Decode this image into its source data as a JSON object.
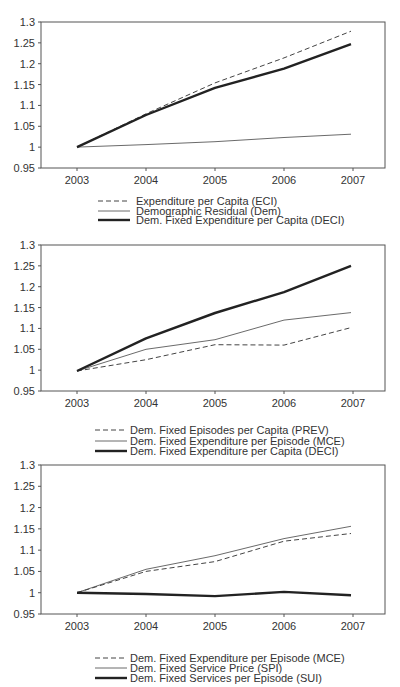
{
  "chart_data": [
    {
      "type": "line",
      "title": "",
      "xlabel": "",
      "ylabel": "",
      "categories": [
        "2003",
        "2004",
        "2005",
        "2006",
        "2007"
      ],
      "yticks": [
        "1.3",
        "1.25",
        "1.2",
        "1.15",
        "1.1",
        "1.05",
        "1",
        "0.95"
      ],
      "ylim": [
        0.95,
        1.3
      ],
      "grid": false,
      "legend_position": "bottom",
      "series": [
        {
          "name": "Expenditure per Capita (ECI)",
          "style": "dashed",
          "width": 1,
          "values": [
            1.0,
            1.08,
            1.154,
            1.214,
            1.278
          ]
        },
        {
          "name": "Demographic Residual (Dem)",
          "style": "solid",
          "width": 0.8,
          "values": [
            1.0,
            1.006,
            1.013,
            1.023,
            1.031
          ]
        },
        {
          "name": "Dem. Fixed Expenditure per Capita (DECI)",
          "style": "solid",
          "width": 2.4,
          "values": [
            1.0,
            1.077,
            1.142,
            1.188,
            1.247
          ]
        }
      ]
    },
    {
      "type": "line",
      "title": "",
      "xlabel": "",
      "ylabel": "",
      "categories": [
        "2003",
        "2004",
        "2005",
        "2006",
        "2007"
      ],
      "yticks": [
        "1.3",
        "1.25",
        "1.2",
        "1.15",
        "1.1",
        "1.05",
        "1",
        "0.95"
      ],
      "ylim": [
        0.95,
        1.3
      ],
      "grid": false,
      "legend_position": "bottom",
      "series": [
        {
          "name": "Dem. Fixed Episodes per Capita (PREV)",
          "style": "dashed",
          "width": 1,
          "values": [
            0.998,
            1.025,
            1.061,
            1.06,
            1.102
          ]
        },
        {
          "name": "Dem. Fixed Expenditure per Episode (MCE)",
          "style": "solid",
          "width": 0.8,
          "values": [
            0.998,
            1.05,
            1.073,
            1.12,
            1.138
          ]
        },
        {
          "name": "Dem. Fixed Expenditure per Capita (DECI)",
          "style": "solid",
          "width": 2.4,
          "values": [
            0.998,
            1.076,
            1.137,
            1.187,
            1.25
          ]
        }
      ]
    },
    {
      "type": "line",
      "title": "",
      "xlabel": "",
      "ylabel": "",
      "categories": [
        "2003",
        "2004",
        "2005",
        "2006",
        "2007"
      ],
      "yticks": [
        "1.3",
        "1.25",
        "1.2",
        "1.15",
        "1.1",
        "1.05",
        "1",
        "0.95"
      ],
      "ylim": [
        0.95,
        1.3
      ],
      "grid": false,
      "legend_position": "bottom",
      "series": [
        {
          "name": "Dem. Fixed Expenditure per Episode (MCE)",
          "style": "dashed",
          "width": 1,
          "values": [
            1.0,
            1.05,
            1.073,
            1.121,
            1.139
          ]
        },
        {
          "name": "Dem. Fixed Service Price (SPI)",
          "style": "solid",
          "width": 0.8,
          "values": [
            1.0,
            1.055,
            1.087,
            1.127,
            1.156
          ]
        },
        {
          "name": "Dem. Fixed Services per Episode (SUI)",
          "style": "solid",
          "width": 2.4,
          "values": [
            1.0,
            0.997,
            0.992,
            1.002,
            0.994
          ]
        }
      ]
    }
  ]
}
